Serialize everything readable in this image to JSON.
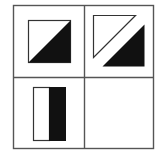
{
  "puzzle": {
    "type": "2x2 matrix reasoning puzzle",
    "grid": {
      "rows": 2,
      "cols": 2,
      "line_color": "#555555",
      "background": "#ffffff"
    },
    "colors": {
      "fill_black": "#111111",
      "stroke": "#333333",
      "fill_white": "#ffffff"
    },
    "cells": [
      {
        "position": "top-left",
        "content": "square split along diagonal; lower-right triangle black, upper-left white"
      },
      {
        "position": "top-right",
        "content": "square split along diagonal and separated; upper-left white triangle outline offset up-left, lower-right black triangle offset down-right"
      },
      {
        "position": "bottom-left",
        "content": "vertical rectangle split in half; left half white, right half black"
      },
      {
        "position": "bottom-right",
        "content": "empty (answer cell)"
      }
    ]
  }
}
